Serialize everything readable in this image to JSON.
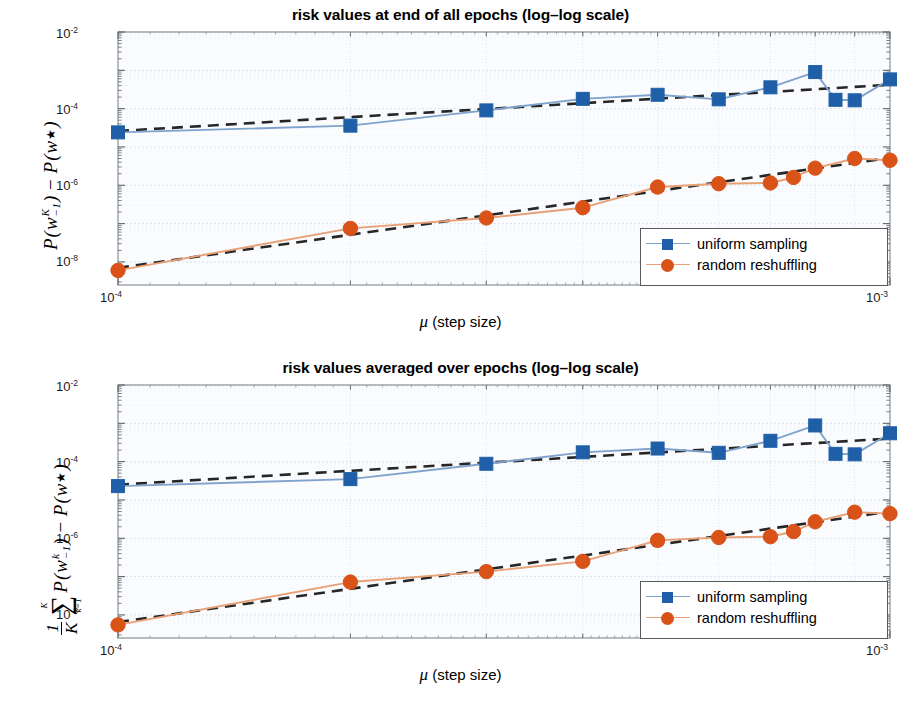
{
  "figure": {
    "width": 921,
    "height": 706,
    "background": "#ffffff"
  },
  "colors": {
    "uniform_sampling": "#1f5fa8",
    "random_reshuffling": "#d95319",
    "uniform_line": "#7fa3cc",
    "random_line": "#e8a077",
    "fit_line": "#262626",
    "axis": "#8c9196",
    "grid": "#d8e2ee",
    "plot_background": "#fbfcfe"
  },
  "legend": {
    "items": [
      {
        "label": "uniform sampling",
        "marker": "square",
        "color": "#1f5fa8",
        "line_color": "#7fa3cc"
      },
      {
        "label": "random reshuffling",
        "marker": "circle",
        "color": "#d95319",
        "line_color": "#e8a077"
      }
    ]
  },
  "axis_labels": {
    "x": {
      "mu": "μ",
      "rest": "(step size)"
    },
    "x_ticks": [
      {
        "label_base": "10",
        "label_exp": "-4",
        "value": 0.0001
      },
      {
        "label_base": "10",
        "label_exp": "-3",
        "value": 0.001
      }
    ],
    "y_ticks": [
      {
        "label_base": "10",
        "label_exp": "-2",
        "value": 0.01
      },
      {
        "label_base": "10",
        "label_exp": "-4",
        "value": 0.0001
      },
      {
        "label_base": "10",
        "label_exp": "-6",
        "value": 1e-06
      },
      {
        "label_base": "10",
        "label_exp": "-8",
        "value": 1e-08
      }
    ]
  },
  "chart_data": [
    {
      "id": "top",
      "type": "line",
      "title": "risk values at end of all epochs (log–log scale)",
      "xlabel": "μ (step size)",
      "ylabel": "P(w^K_{-1}) - P(w*)",
      "ylabel_parts": {
        "lead": "",
        "P1": "P",
        "w": "w",
        "sup": "K",
        "sub": "-1",
        "minus": "−",
        "P2": "P",
        "wstar": "w",
        "star": "★"
      },
      "xscale": "log",
      "yscale": "log",
      "xlim": [
        0.0001,
        0.001
      ],
      "ylim": [
        2.5e-09,
        0.01
      ],
      "grid": true,
      "legend_position": "lower right",
      "x": [
        0.0001,
        0.0002,
        0.0003,
        0.0004,
        0.0005,
        0.0006,
        0.0007,
        0.0008,
        0.0009,
        0.001
      ],
      "series": [
        {
          "name": "uniform sampling",
          "marker": "square",
          "color": "#1f5fa8",
          "values": [
            2.4e-05,
            3.6e-05,
            9e-05,
            0.00018,
            0.00023,
            0.000175,
            0.00036,
            0.0009,
            0.000165,
            0.00058
          ],
          "extra_x": [
            0.00085
          ],
          "extra_values": [
            0.00017
          ]
        },
        {
          "name": "random reshuffling",
          "marker": "circle",
          "color": "#d95319",
          "values": [
            6e-09,
            7.5e-08,
            1.4e-07,
            2.6e-07,
            9e-07,
            1.1e-06,
            1.15e-06,
            2.8e-06,
            5e-06,
            4.5e-06
          ],
          "extra_x": [
            0.00075
          ],
          "extra_values": [
            1.6e-06
          ]
        }
      ],
      "fit_lines": [
        {
          "name": "uniform fit",
          "style": "dashed",
          "color": "#262626",
          "x": [
            0.0001,
            0.001
          ],
          "y": [
            2.6e-05,
            0.00042
          ]
        },
        {
          "name": "reshuffling fit",
          "style": "dashed",
          "color": "#262626",
          "x": [
            0.0001,
            0.001
          ],
          "y": [
            7e-09,
            5.2e-06
          ]
        }
      ]
    },
    {
      "id": "bottom",
      "type": "line",
      "title": "risk values averaged over epochs (log–log scale)",
      "xlabel": "μ (step size)",
      "ylabel": "(1/K) sum_{k=1}^{K} P(w^k_{-1}) - P(w*)",
      "xscale": "log",
      "yscale": "log",
      "xlim": [
        0.0001,
        0.001
      ],
      "ylim": [
        2.5e-09,
        0.01
      ],
      "grid": true,
      "legend_position": "lower right",
      "x": [
        0.0001,
        0.0002,
        0.0003,
        0.0004,
        0.0005,
        0.0006,
        0.0007,
        0.0008,
        0.0009,
        0.001
      ],
      "series": [
        {
          "name": "uniform sampling",
          "marker": "square",
          "color": "#1f5fa8",
          "values": [
            2.3e-05,
            3.5e-05,
            8.8e-05,
            0.000175,
            0.00022,
            0.00017,
            0.00035,
            0.00088,
            0.000155,
            0.00055
          ],
          "extra_x": [
            0.00085
          ],
          "extra_values": [
            0.00016
          ]
        },
        {
          "name": "random reshuffling",
          "marker": "circle",
          "color": "#d95319",
          "values": [
            5.5e-09,
            7.2e-08,
            1.35e-07,
            2.5e-07,
            8.8e-07,
            1.05e-06,
            1.1e-06,
            2.7e-06,
            4.8e-06,
            4.4e-06
          ],
          "extra_x": [
            0.00075
          ],
          "extra_values": [
            1.5e-06
          ]
        }
      ],
      "fit_lines": [
        {
          "name": "uniform fit",
          "style": "dashed",
          "color": "#262626",
          "x": [
            0.0001,
            0.001
          ],
          "y": [
            2.5e-05,
            0.0004
          ]
        },
        {
          "name": "reshuffling fit",
          "style": "dashed",
          "color": "#262626",
          "x": [
            0.0001,
            0.001
          ],
          "y": [
            6.5e-09,
            5e-06
          ]
        }
      ]
    }
  ]
}
